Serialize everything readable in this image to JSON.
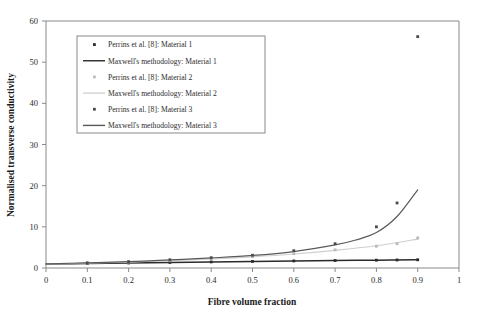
{
  "chart_data": {
    "type": "line",
    "title": "",
    "xlabel": "Fibre volume fraction",
    "ylabel": "Normalised transverse conductivity",
    "xlim": [
      0,
      1
    ],
    "ylim": [
      0,
      60
    ],
    "xticks": [
      "0",
      "0.1",
      "0.2",
      "0.3",
      "0.4",
      "0.5",
      "0.6",
      "0.7",
      "0.8",
      "0.9",
      "1"
    ],
    "xtick_values": [
      0,
      0.1,
      0.2,
      0.3,
      0.4,
      0.5,
      0.6,
      0.7,
      0.8,
      0.9,
      1
    ],
    "yticks": [
      "0",
      "10",
      "20",
      "30",
      "40",
      "50",
      "60"
    ],
    "ytick_values": [
      0,
      10,
      20,
      30,
      40,
      50,
      60
    ],
    "grid": false,
    "legend_position": "upper-left-inset",
    "series": [
      {
        "name": "Perrins et al. [8]: Material 1",
        "kind": "scatter",
        "color": "#2a2a2a",
        "marker": "dot",
        "x": [
          0.1,
          0.2,
          0.3,
          0.4,
          0.5,
          0.6,
          0.7,
          0.8,
          0.85,
          0.9
        ],
        "values": [
          1.1,
          1.22,
          1.35,
          1.48,
          1.6,
          1.72,
          1.82,
          1.9,
          1.95,
          2.0
        ]
      },
      {
        "name": "Maxwell's methodology: Material 1",
        "kind": "line",
        "color": "#2a2a2a",
        "width": 1.5,
        "x": [
          0,
          0.1,
          0.2,
          0.3,
          0.4,
          0.5,
          0.6,
          0.7,
          0.8,
          0.9
        ],
        "values": [
          1.0,
          1.1,
          1.22,
          1.35,
          1.48,
          1.6,
          1.72,
          1.82,
          1.9,
          2.0
        ]
      },
      {
        "name": "Perrins et al. [8]: Material 2",
        "kind": "scatter",
        "color": "#b9b9b9",
        "marker": "dot",
        "x": [
          0.1,
          0.2,
          0.3,
          0.4,
          0.5,
          0.6,
          0.7,
          0.8,
          0.85,
          0.9
        ],
        "values": [
          1.2,
          1.45,
          1.78,
          2.2,
          2.75,
          3.5,
          4.4,
          5.3,
          5.9,
          7.3
        ]
      },
      {
        "name": "Maxwell's methodology: Material 2",
        "kind": "line",
        "color": "#cfcfcf",
        "width": 1.2,
        "x": [
          0,
          0.1,
          0.2,
          0.3,
          0.4,
          0.5,
          0.6,
          0.7,
          0.8,
          0.9
        ],
        "values": [
          1.0,
          1.2,
          1.45,
          1.78,
          2.2,
          2.72,
          3.4,
          4.3,
          5.4,
          7.0
        ]
      },
      {
        "name": "Perrins et al. [8]: Material 3",
        "kind": "scatter",
        "color": "#4a4a4a",
        "marker": "dot",
        "x": [
          0.1,
          0.2,
          0.3,
          0.4,
          0.5,
          0.6,
          0.7,
          0.8,
          0.85,
          0.9
        ],
        "values": [
          1.25,
          1.55,
          2.0,
          2.5,
          3.1,
          4.2,
          5.9,
          10.0,
          15.8,
          56.2
        ]
      },
      {
        "name": "Maxwell's methodology: Material 3",
        "kind": "line",
        "color": "#5a5a5a",
        "width": 1.2,
        "x": [
          0,
          0.1,
          0.2,
          0.3,
          0.4,
          0.5,
          0.6,
          0.7,
          0.75,
          0.8,
          0.85,
          0.9
        ],
        "values": [
          1.0,
          1.25,
          1.55,
          1.95,
          2.45,
          3.05,
          4.0,
          5.6,
          6.8,
          8.6,
          12.5,
          19.0
        ]
      }
    ],
    "legend": [
      {
        "label": "Perrins et al. [8]: Material 1",
        "type": "marker",
        "color": "#2a2a2a"
      },
      {
        "label": "Maxwell's methodology: Material 1",
        "type": "line",
        "color": "#2a2a2a"
      },
      {
        "label": "Perrins et al. [8]: Material 2",
        "type": "marker",
        "color": "#bdbdbd"
      },
      {
        "label": "Maxwell's methodology: Material 2",
        "type": "line",
        "color": "#d2d2d2"
      },
      {
        "label": "Perrins et al. [8]: Material 3",
        "type": "marker",
        "color": "#4a4a4a"
      },
      {
        "label": "Maxwell's methodology: Material 3",
        "type": "line",
        "color": "#585858"
      }
    ],
    "annotations": []
  }
}
